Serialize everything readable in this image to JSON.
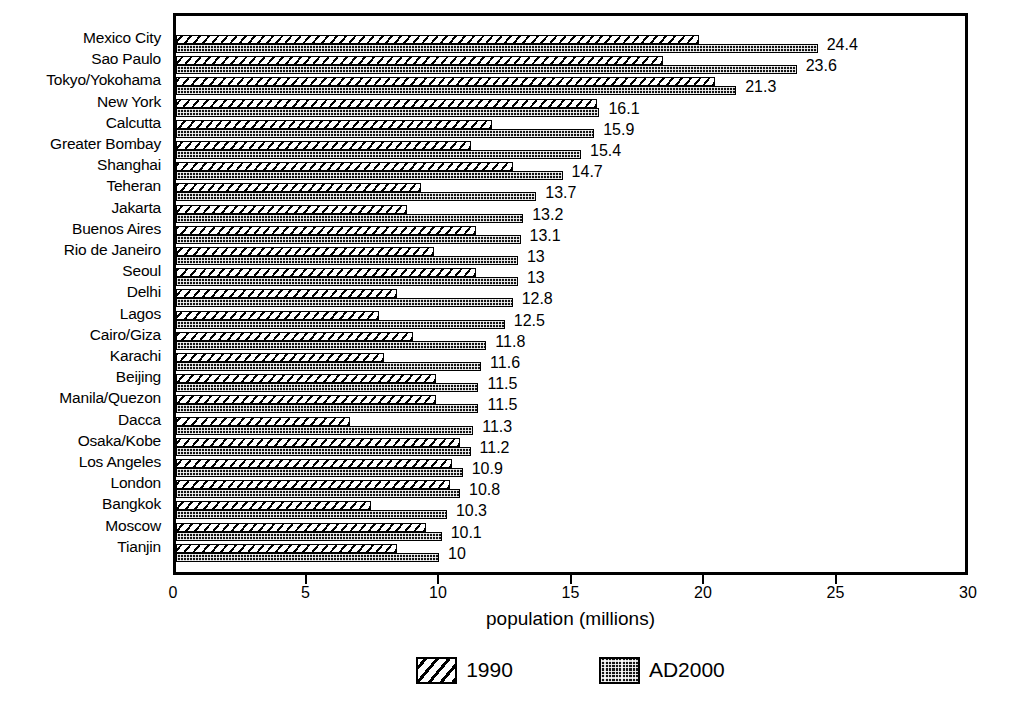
{
  "chart_data": {
    "type": "bar",
    "orientation": "horizontal",
    "title": "",
    "xlabel": "population (millions)",
    "ylabel": "",
    "xlim": [
      0,
      30
    ],
    "xticks": [
      0,
      5,
      10,
      15,
      20,
      25,
      30
    ],
    "xticklabels": [
      "0",
      "5",
      "10",
      "15",
      "20",
      "25",
      "30"
    ],
    "grid": false,
    "legend_position": "bottom-center",
    "categories": [
      "Mexico City",
      "Sao Paulo",
      "Tokyo/Yokohama",
      "New York",
      "Calcutta",
      "Greater Bombay",
      "Shanghai",
      "Teheran",
      "Jakarta",
      "Buenos Aires",
      "Rio de Janeiro",
      "Seoul",
      "Delhi",
      "Lagos",
      "Cairo/Giza",
      "Karachi",
      "Beijing",
      "Manila/Quezon",
      "Dacca",
      "Osaka/Kobe",
      "Los Angeles",
      "London",
      "Bangkok",
      "Moscow",
      "Tianjin"
    ],
    "series": [
      {
        "name": "1990",
        "pattern": "diagonal-hatch",
        "values": [
          19.9,
          18.5,
          20.5,
          16.0,
          12.0,
          11.2,
          12.8,
          9.3,
          8.8,
          11.4,
          9.8,
          11.4,
          8.4,
          7.7,
          9.0,
          7.9,
          9.9,
          9.9,
          6.6,
          10.8,
          10.5,
          10.4,
          7.4,
          9.5,
          8.4
        ]
      },
      {
        "name": "AD2000",
        "pattern": "dot-fill",
        "values": [
          24.4,
          23.6,
          21.3,
          16.1,
          15.9,
          15.4,
          14.7,
          13.7,
          13.2,
          13.1,
          13.0,
          13.0,
          12.8,
          12.5,
          11.8,
          11.6,
          11.5,
          11.5,
          11.3,
          11.2,
          10.9,
          10.8,
          10.3,
          10.1,
          10.0
        ]
      }
    ],
    "data_labels": [
      "24.4",
      "23.6",
      "21.3",
      "16.1",
      "15.9",
      "15.4",
      "14.7",
      "13.7",
      "13.2",
      "13.1",
      "13",
      "13",
      "12.8",
      "12.5",
      "11.8",
      "11.6",
      "11.5",
      "11.5",
      "11.3",
      "11.2",
      "10.9",
      "10.8",
      "10.3",
      "10.1",
      "10"
    ],
    "colors": {
      "ink": "#000000",
      "background": "#ffffff",
      "series_1990_fill": "#ffffff",
      "series_ad2000_fill": "#141414"
    }
  },
  "legend": {
    "entries": [
      {
        "label": "1990",
        "swatch": "hatch-swatch"
      },
      {
        "label": "AD2000",
        "swatch": "dotted-swatch"
      }
    ]
  }
}
